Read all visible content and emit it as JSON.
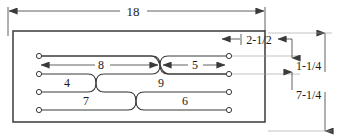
{
  "drawing": {
    "title": "Parallel-wire crossover layout dimensioned drawing",
    "units": "inches",
    "stroke_color": "#3a3a3a",
    "text_color": "#1a1a1a",
    "background": "#ffffff"
  },
  "dimensions": {
    "overall_width": "18",
    "overall_height": "7-1/4",
    "right_offset": "2-1/2",
    "top_row_spacing": "1-1/4"
  },
  "segment_labels": {
    "row1_left": "8",
    "row1_right": "5",
    "row2_left": "4",
    "row2_right": "9",
    "row3_left": "7",
    "row3_right": "6"
  },
  "endpoints": {
    "left_count": 4,
    "right_count": 4
  },
  "crossings": [
    {
      "name": "crossing-upper",
      "between_rows": "1-2"
    },
    {
      "name": "crossing-middle",
      "between_rows": "2-3"
    },
    {
      "name": "crossing-lower",
      "between_rows": "3-4"
    }
  ]
}
